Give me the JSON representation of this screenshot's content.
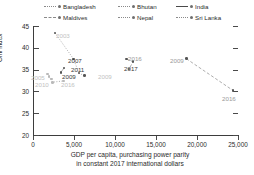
{
  "chart_data": {
    "type": "scatter",
    "title": "",
    "xlabel": "GDP per capita, purchasing power parity in constant 2017 international dollars",
    "xlabel_line1": "GDP per capita, purchasing power parity",
    "xlabel_line2": "in constant 2017 international dollars",
    "ylabel": "Gini index",
    "xlim": [
      0,
      25000
    ],
    "ylim": [
      20,
      45
    ],
    "xticks": [
      0,
      5000,
      10000,
      15000,
      20000,
      25000
    ],
    "xtick_labels": [
      "0",
      "5,000",
      "10,000",
      "15,000",
      "20,000",
      "25,000"
    ],
    "yticks": [
      20,
      25,
      30,
      35,
      40,
      45
    ],
    "ytick_labels": [
      "20",
      "25",
      "30",
      "35",
      "40",
      "45"
    ],
    "grid": false,
    "legend_position": "top",
    "series": [
      {
        "name": "Bangladesh",
        "line_style": "dotted",
        "points": [
          {
            "label": "2005",
            "x": 1950,
            "y": 33.4
          },
          {
            "label": "2010",
            "x": 2400,
            "y": 32.1
          },
          {
            "label": "2016",
            "x": 3750,
            "y": 32.4
          }
        ]
      },
      {
        "name": "Bhutan",
        "line_style": "dotted",
        "points": [
          {
            "label": "2003",
            "x": 2700,
            "y": 43.4
          },
          {
            "label": "2007",
            "x": 4950,
            "y": 37.4
          },
          {
            "label": "2012",
            "x": 5600,
            "y": 34.2
          },
          {
            "label": "2017",
            "x": 6250,
            "y": 33.6
          }
        ]
      },
      {
        "name": "India",
        "line_style": "solid",
        "points": [
          {
            "label": "2009",
            "x": 3400,
            "y": 34.4
          },
          {
            "label": "2011",
            "x": 3800,
            "y": 35.4
          }
        ]
      },
      {
        "name": "Maldives",
        "line_style": "dashed",
        "points": [
          {
            "label": "2009",
            "x": 11400,
            "y": 37.4
          },
          {
            "label": "2016",
            "x": 12200,
            "y": 36.8
          },
          {
            "label": "2017",
            "x": 11700,
            "y": 35.1
          }
        ]
      },
      {
        "name": "Nepal",
        "line_style": "dotted",
        "points": [
          {
            "label": "2003",
            "x": 1750,
            "y": 34.0
          },
          {
            "label": "2010",
            "x": 2250,
            "y": 32.8
          }
        ]
      },
      {
        "name": "Sri Lanka",
        "line_style": "dashed",
        "points": [
          {
            "label": "2009",
            "x": 18700,
            "y": 37.5
          },
          {
            "label": "2016",
            "x": 24400,
            "y": 30.2
          }
        ]
      }
    ],
    "annotations": [
      {
        "text": "2003",
        "x_px": 56,
        "y_px": 32,
        "tone": "faint"
      },
      {
        "text": "2007",
        "x_px": 68,
        "y_px": 57,
        "tone": "normal"
      },
      {
        "text": "2011",
        "x_px": 71,
        "y_px": 66,
        "tone": "normal"
      },
      {
        "text": "2009",
        "x_px": 62,
        "y_px": 73,
        "tone": "normal"
      },
      {
        "text": "2005",
        "x_px": 31,
        "y_px": 74,
        "tone": "faint"
      },
      {
        "text": "2010",
        "x_px": 35,
        "y_px": 81,
        "tone": "faint"
      },
      {
        "text": "2016",
        "x_px": 61,
        "y_px": 81,
        "tone": "faint"
      },
      {
        "text": "2009",
        "x_px": 98,
        "y_px": 73,
        "tone": "faint"
      },
      {
        "text": "2016",
        "x_px": 128,
        "y_px": 55,
        "tone": "mid"
      },
      {
        "text": "2017",
        "x_px": 124,
        "y_px": 65,
        "tone": "normal"
      },
      {
        "text": "2009",
        "x_px": 170,
        "y_px": 57,
        "tone": "mid"
      },
      {
        "text": "2016",
        "x_px": 222,
        "y_px": 95,
        "tone": "mid"
      }
    ]
  },
  "legend": {
    "items": [
      {
        "label": "Bangladesh",
        "style": "dotted"
      },
      {
        "label": "Bhutan",
        "style": "dotted"
      },
      {
        "label": "India",
        "style": "solid"
      },
      {
        "label": "Maldives",
        "style": "dashed"
      },
      {
        "label": "Nepal",
        "style": "dotted"
      },
      {
        "label": "Sri Lanka",
        "style": "dotted"
      }
    ]
  },
  "colors": {
    "axis": "#3d3d3d",
    "text": "#2b2b2b",
    "marker": "#555555",
    "marker_light": "#b9b9b9",
    "line": "#8a8a8a"
  }
}
